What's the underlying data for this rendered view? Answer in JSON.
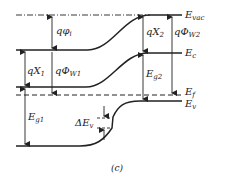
{
  "figure": {
    "panel_label": "(c)",
    "type": "heterojunction energy band diagram",
    "line_color": "#222222",
    "background": "#ffffff"
  },
  "levels": {
    "vacuum": {
      "base": "E",
      "sub": "vac"
    },
    "conduction": {
      "base": "E",
      "sub": "c"
    },
    "fermi": {
      "base": "E",
      "sub": "f"
    },
    "valence": {
      "base": "E",
      "sub": "v"
    }
  },
  "quantities": {
    "phi_i": {
      "base": "qφ",
      "sub": "i"
    },
    "chi1": {
      "base": "qX",
      "sub": "1"
    },
    "phi_w1": {
      "base": "qΦ",
      "sub": "W1"
    },
    "eg1": {
      "base": "E",
      "sub": "g1"
    },
    "delta_ev": {
      "base": "ΔE",
      "sub": "v"
    },
    "chi2": {
      "base": "qX",
      "sub": "2"
    },
    "eg2": {
      "base": "E",
      "sub": "g2"
    },
    "phi_w2": {
      "base": "qΦ",
      "sub": "W2"
    }
  }
}
